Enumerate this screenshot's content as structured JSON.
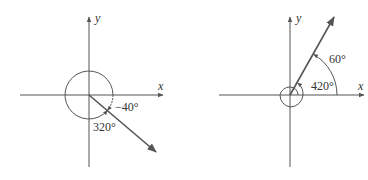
{
  "figures": [
    {
      "id": "left",
      "description": "Angle of -40 degrees coterminal with 320 degrees",
      "axes": {
        "x_label": "x",
        "y_label": "y"
      },
      "ray_angle_deg": -40,
      "labels": {
        "negative_angle": "−40°",
        "positive_angle": "320°"
      }
    },
    {
      "id": "right",
      "description": "Angle of 420 degrees coterminal with 60 degrees",
      "axes": {
        "x_label": "x",
        "y_label": "y"
      },
      "ray_angle_deg": 60,
      "labels": {
        "small_angle": "60°",
        "large_angle": "420°"
      }
    }
  ],
  "colors": {
    "line": "#555555",
    "text": "#333333"
  }
}
